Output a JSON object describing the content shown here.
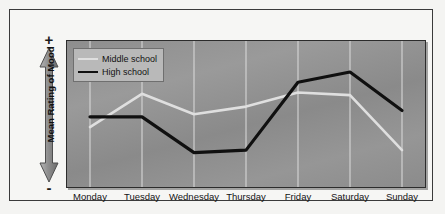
{
  "figure": {
    "y_axis_label": "Mean Rating of Mood",
    "y_axis_top_symbol": "+",
    "y_axis_bottom_symbol": "-"
  },
  "legend": {
    "items": [
      {
        "label": "Middle school",
        "color": "#dfdfdf"
      },
      {
        "label": "High school",
        "color": "#101010"
      }
    ]
  },
  "colors": {
    "middle_school": "#dfdfdf",
    "high_school": "#101010",
    "gridline": "#dcdcdc",
    "plot_background": "#909090",
    "frame": "#3a3a3a"
  },
  "chart_data": {
    "type": "line",
    "title": "",
    "xlabel": "",
    "ylabel": "Mean Rating of Mood",
    "categories": [
      "Monday",
      "Tuesday",
      "Wednesday",
      "Thursday",
      "Friday",
      "Saturday",
      "Sunday"
    ],
    "ylim": [
      0,
      10
    ],
    "ytick_labels": [
      "-",
      "+"
    ],
    "grid": "vertical gridlines at each day",
    "legend_position": "top-left inside plot",
    "series": [
      {
        "name": "Middle school",
        "color": "#dfdfdf",
        "values": [
          3.9,
          6.5,
          4.9,
          5.5,
          6.6,
          6.4,
          2.1
        ]
      },
      {
        "name": "High school",
        "color": "#101010",
        "values": [
          4.7,
          4.7,
          1.9,
          2.1,
          7.4,
          8.2,
          5.2
        ]
      }
    ],
    "annotations": [
      "Mood axis is unlabeled numerically; ranges from '-' (low) at bottom to '+' (high) at top",
      "Both groups show lowest mood midweek and highest mood on Friday/Saturday",
      "High school mood drops more sharply on Wednesday and Thursday than middle school",
      "Middle school mood falls steeply on Sunday, below its Wednesday level"
    ]
  },
  "x_labels": [
    "Monday",
    "Tuesday",
    "Wednesday",
    "Thursday",
    "Friday",
    "Saturday",
    "Sunday"
  ]
}
